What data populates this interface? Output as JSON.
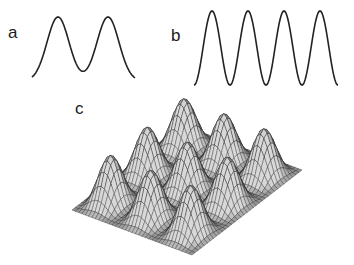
{
  "figure": {
    "panels": [
      {
        "id": "a",
        "label": "a",
        "description": "double-peaked profile curve",
        "profile": {
          "peaks": 2,
          "center_dip_relative_height": 0.37
        }
      },
      {
        "id": "b",
        "label": "b",
        "description": "periodic sinusoidal profile",
        "profile": {
          "peaks": 4
        }
      },
      {
        "id": "c",
        "label": "c",
        "description": "3D mesh surface with periodic egg-crate peaks",
        "surface": {
          "grid_peaks_x": 3,
          "grid_peaks_y": 3
        }
      }
    ],
    "colors": {
      "line": "#222222",
      "mesh_light": "#d8d8d8",
      "mesh_dark": "#3a3a3a",
      "background": "#ffffff"
    }
  }
}
